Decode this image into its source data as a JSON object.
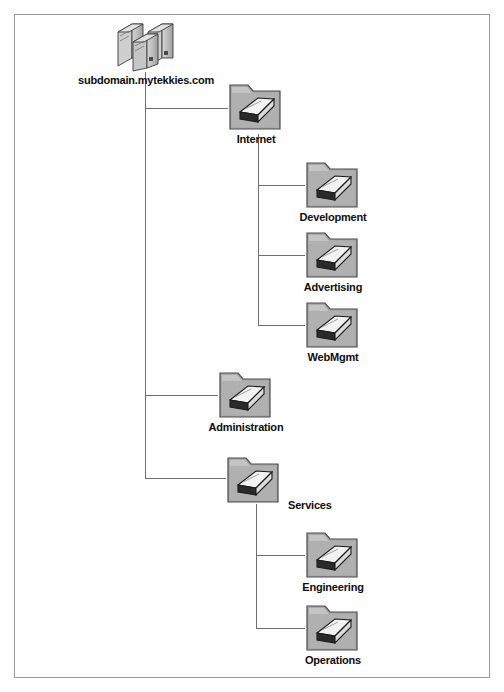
{
  "diagram": {
    "background_color": "#ffffff",
    "border_color": "#9a9a9a",
    "line_color": "#6e6e6e",
    "folder_face_color": "#a9a9a9",
    "folder_edge_color": "#4a4a4a",
    "label_color": "#0d0d0d"
  },
  "root": {
    "label": "subdomain.mytekkies.com",
    "icon": "server-stack-icon"
  },
  "nodes": [
    {
      "id": "internet",
      "label": "Internet",
      "icon": "folder-book-icon",
      "label_position": "below"
    },
    {
      "id": "development",
      "label": "Development",
      "icon": "folder-book-icon",
      "label_position": "below"
    },
    {
      "id": "advertising",
      "label": "Advertising",
      "icon": "folder-book-icon",
      "label_position": "below"
    },
    {
      "id": "webmgmt",
      "label": "WebMgmt",
      "icon": "folder-book-icon",
      "label_position": "below"
    },
    {
      "id": "administration",
      "label": "Administration",
      "icon": "folder-book-icon",
      "label_position": "below"
    },
    {
      "id": "services",
      "label": "Services",
      "icon": "folder-book-icon",
      "label_position": "right"
    },
    {
      "id": "engineering",
      "label": "Engineering",
      "icon": "folder-book-icon",
      "label_position": "below"
    },
    {
      "id": "operations",
      "label": "Operations",
      "icon": "folder-book-icon",
      "label_position": "below"
    }
  ]
}
